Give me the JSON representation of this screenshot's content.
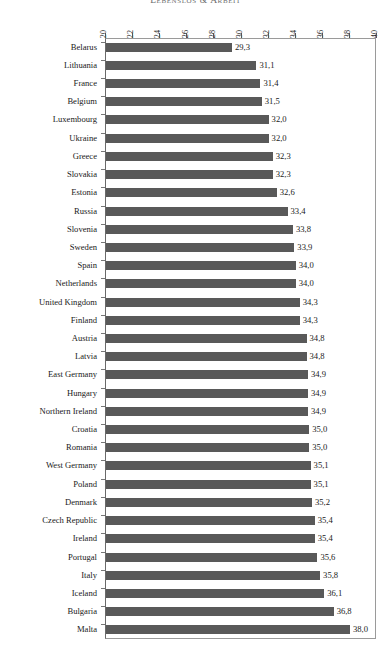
{
  "chart_data": {
    "type": "bar",
    "orientation": "horizontal",
    "title": "Lebenslos & Arbeit",
    "xlabel": "",
    "ylabel": "",
    "xlim": [
      20,
      40
    ],
    "xticks": [
      20,
      22,
      24,
      26,
      28,
      30,
      32,
      34,
      36,
      38,
      40
    ],
    "xtick_labels": [
      "20",
      "22",
      "24",
      "26",
      "28",
      "30",
      "32",
      "34",
      "36",
      "38",
      "40"
    ],
    "grid": false,
    "legend": null,
    "bar_color": "#595959",
    "decimal_separator": ",",
    "categories": [
      "Belarus",
      "Lithuania",
      "France",
      "Belgium",
      "Luxembourg",
      "Ukraine",
      "Greece",
      "Slovakia",
      "Estonia",
      "Russia",
      "Slovenia",
      "Sweden",
      "Spain",
      "Netherlands",
      "United Kingdom",
      "Finland",
      "Austria",
      "Latvia",
      "East Germany",
      "Hungary",
      "Northern Ireland",
      "Croatia",
      "Romania",
      "West Germany",
      "Poland",
      "Denmark",
      "Czech Republic",
      "Ireland",
      "Portugal",
      "Italy",
      "Iceland",
      "Bulgaria",
      "Malta"
    ],
    "values": [
      29.3,
      31.1,
      31.4,
      31.5,
      32.0,
      32.0,
      32.3,
      32.3,
      32.6,
      33.4,
      33.8,
      33.9,
      34.0,
      34.0,
      34.3,
      34.3,
      34.8,
      34.8,
      34.9,
      34.9,
      34.9,
      35.0,
      35.0,
      35.1,
      35.1,
      35.2,
      35.4,
      35.4,
      35.6,
      35.8,
      36.1,
      36.8,
      38.0
    ],
    "value_labels": [
      "29,3",
      "31,1",
      "31,4",
      "31,5",
      "32,0",
      "32,0",
      "32,3",
      "32,3",
      "32,6",
      "33,4",
      "33,8",
      "33,9",
      "34,0",
      "34,0",
      "34,3",
      "34,3",
      "34,8",
      "34,8",
      "34,9",
      "34,9",
      "34,9",
      "35,0",
      "35,0",
      "35,1",
      "35,1",
      "35,2",
      "35,4",
      "35,4",
      "35,6",
      "35,8",
      "36,1",
      "36,8",
      "38,0"
    ]
  },
  "bottom_note": ""
}
